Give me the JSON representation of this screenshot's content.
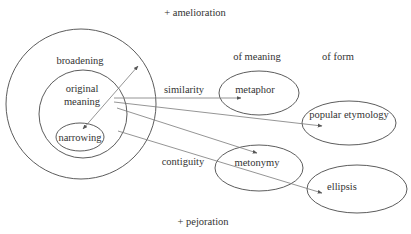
{
  "diagram": {
    "top_label": "+ amelioration",
    "bottom_label": "+ pejoration",
    "column_headers": {
      "meaning": "of meaning",
      "form": "of form"
    },
    "circles": {
      "outer": "broadening",
      "inner_line1": "original",
      "inner_line2": "meaning",
      "core": "narrowing"
    },
    "relations": {
      "similarity": "similarity",
      "contiguity": "contiguity"
    },
    "targets": {
      "metaphor": "metaphor",
      "popular_etymology": "popular etymology",
      "metonymy": "metonymy",
      "ellipsis": "ellipsis"
    },
    "colors": {
      "stroke": "#4a4a4a",
      "arrow": "#7a7a7a",
      "text": "#333333",
      "background": "#ffffff"
    }
  }
}
